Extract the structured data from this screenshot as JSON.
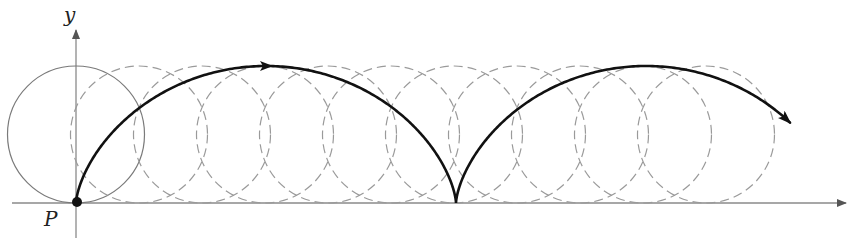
{
  "diagram": {
    "type": "cycloid-generation",
    "labels": {
      "y_axis": "y",
      "point": "P"
    },
    "colors": {
      "curve": "#111111",
      "circle_solid": "#7a7a7a",
      "circle_dashed": "#9a9a9a",
      "axis": "#8a8a8a",
      "point": "#111111"
    },
    "geometry": {
      "origin": [
        76,
        203
      ],
      "radius": 68.5,
      "arch_period_px": 380,
      "circle_centers_x": [
        76,
        139,
        202,
        265,
        328,
        391,
        454,
        517,
        580,
        643,
        706
      ],
      "first_circle_style": "solid",
      "other_circles_style": "dashed",
      "arches": 2,
      "curve_end_x": 790
    },
    "icons": {
      "y_axis_arrow": "arrow-up-icon",
      "x_axis_arrow": "arrow-right-icon",
      "curve_direction_arrow": "arrow-right-icon",
      "curve_end_arrow": "arrow-down-right-icon"
    }
  }
}
